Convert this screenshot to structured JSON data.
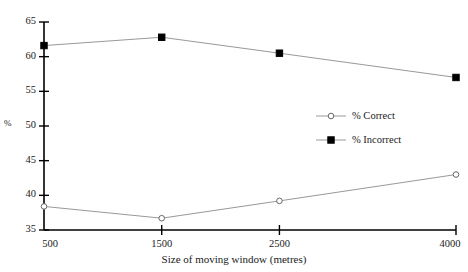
{
  "chart_data": {
    "type": "line",
    "title": "",
    "xlabel": "Size of moving window (metres)",
    "ylabel": "%",
    "x": [
      500,
      1500,
      2500,
      4000
    ],
    "xtick_labels": [
      "500",
      "1500",
      "2500",
      "4000"
    ],
    "ytick_labels": [
      "35",
      "40",
      "45",
      "50",
      "55",
      "60",
      "65"
    ],
    "yticks": [
      35,
      40,
      45,
      50,
      55,
      60,
      65
    ],
    "ylim": [
      35,
      65
    ],
    "grid": false,
    "legend_position": "center-right",
    "series": [
      {
        "name": "% Correct",
        "marker": "open-circle",
        "values": [
          38.4,
          36.7,
          39.2,
          43.0
        ]
      },
      {
        "name": "% Incorrect",
        "marker": "filled-square",
        "values": [
          61.6,
          62.8,
          60.5,
          57.0
        ]
      }
    ]
  },
  "legend": {
    "entries": [
      {
        "label": "% Correct"
      },
      {
        "label": "% Incorrect"
      }
    ]
  },
  "colors": {
    "axis": "#000000",
    "line": "#999999",
    "marker_fill": "#000000",
    "marker_open": "#ffffff",
    "background": "#ffffff"
  }
}
